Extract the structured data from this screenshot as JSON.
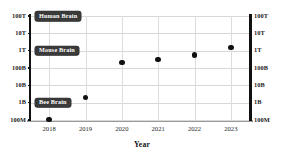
{
  "chart_data": {
    "type": "scatter",
    "title": "",
    "xlabel": "Year",
    "ylabel": "",
    "grid": true,
    "legend": "none",
    "x": [
      2018,
      2019,
      2020,
      2021,
      2022,
      2023
    ],
    "x_tick_labels": [
      "2018",
      "2019",
      "2020",
      "2021",
      "2022",
      "2023"
    ],
    "xlim": [
      2017.5,
      2023.5
    ],
    "y_log": true,
    "ylim": [
      "100M",
      "100T"
    ],
    "y_tick_labels_left": [
      "100T",
      "10T",
      "1T",
      "100B",
      "10B",
      "1B",
      "100M"
    ],
    "y_tick_labels_right": [
      "100T",
      "10T",
      "1T",
      "100B",
      "10B",
      "1B",
      "100M"
    ],
    "y_tick_values": [
      100000000000000.0,
      10000000000000.0,
      1000000000000.0,
      100000000000.0,
      10000000000.0,
      1000000000.0,
      100000000.0
    ],
    "values": [
      110000000.0,
      2000000000.0,
      200000000000.0,
      300000000000.0,
      550000000000.0,
      1500000000000.0
    ],
    "value_labels": [
      "110M",
      "2B",
      "200B",
      "300B",
      "550B",
      "1.5T"
    ],
    "series": [
      {
        "name": "model parameters",
        "points": [
          {
            "x": "2018",
            "y": 110000000.0,
            "y_label": "110M"
          },
          {
            "x": "2019",
            "y": 2000000000.0,
            "y_label": "2B"
          },
          {
            "x": "2020",
            "y": 200000000000.0,
            "y_label": "200B"
          },
          {
            "x": "2021",
            "y": 300000000000.0,
            "y_label": "300B"
          },
          {
            "x": "2022",
            "y": 550000000000.0,
            "y_label": "550B"
          },
          {
            "x": "2023",
            "y": 1500000000000.0,
            "y_label": "1.5T"
          }
        ]
      }
    ],
    "annotations": [
      {
        "label": "Human Brain",
        "y": 100000000000000.0,
        "y_label": "100T"
      },
      {
        "label": "Mouse Brain",
        "y": 1000000000000.0,
        "y_label": "1T"
      },
      {
        "label": "Bee Brain",
        "y": 1000000000.0,
        "y_label": "1B"
      }
    ],
    "colors": {
      "point": "#111111",
      "badge_background": "#3a3a3a",
      "badge_text": "#ffffff",
      "grid": "#d8d8d8",
      "spine": "#111111",
      "background": "#ffffff"
    }
  }
}
